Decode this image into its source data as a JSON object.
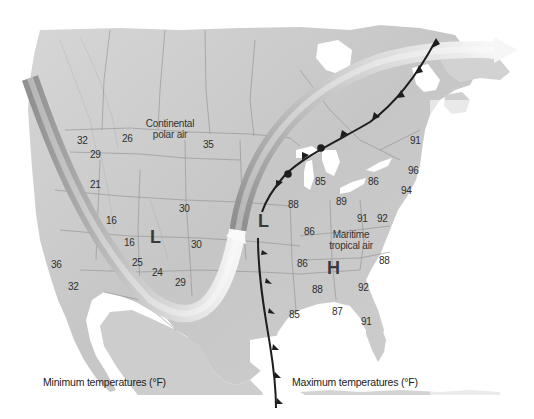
{
  "figure": {
    "cropped_top_text": "",
    "captions": {
      "left": "Minimum temperatures (°F)",
      "right": "Maximum temperatures (°F)"
    },
    "air_masses": [
      {
        "id": "continental-polar",
        "line1": "Continental",
        "line2": "polar air",
        "x": 135,
        "y": 118
      },
      {
        "id": "maritime-tropical",
        "line1": "Maritime",
        "line2": "tropical air",
        "x": 323,
        "y": 229
      }
    ],
    "pressure_centers": [
      {
        "id": "low-west",
        "symbol": "L",
        "x": 150,
        "y": 231
      },
      {
        "id": "low-central",
        "symbol": "L",
        "x": 258,
        "y": 215
      },
      {
        "id": "high-southeast",
        "symbol": "H",
        "x": 328,
        "y": 262
      }
    ],
    "min_temperatures": [
      {
        "value": "32",
        "x": 77,
        "y": 136
      },
      {
        "value": "26",
        "x": 122,
        "y": 134
      },
      {
        "value": "35",
        "x": 203,
        "y": 140
      },
      {
        "value": "29",
        "x": 90,
        "y": 150
      },
      {
        "value": "21",
        "x": 90,
        "y": 180
      },
      {
        "value": "30",
        "x": 179,
        "y": 204
      },
      {
        "value": "16",
        "x": 106,
        "y": 216
      },
      {
        "value": "16",
        "x": 124,
        "y": 238
      },
      {
        "value": "30",
        "x": 191,
        "y": 240
      },
      {
        "value": "36",
        "x": 51,
        "y": 260
      },
      {
        "value": "25",
        "x": 132,
        "y": 258
      },
      {
        "value": "24",
        "x": 152,
        "y": 268
      },
      {
        "value": "32",
        "x": 68,
        "y": 282
      },
      {
        "value": "29",
        "x": 175,
        "y": 278
      }
    ],
    "max_temperatures": [
      {
        "value": "91",
        "x": 410,
        "y": 136
      },
      {
        "value": "85",
        "x": 315,
        "y": 177
      },
      {
        "value": "86",
        "x": 368,
        "y": 177
      },
      {
        "value": "96",
        "x": 408,
        "y": 166
      },
      {
        "value": "94",
        "x": 401,
        "y": 186
      },
      {
        "value": "88",
        "x": 288,
        "y": 200
      },
      {
        "value": "89",
        "x": 336,
        "y": 197
      },
      {
        "value": "91",
        "x": 357,
        "y": 214
      },
      {
        "value": "92",
        "x": 377,
        "y": 214
      },
      {
        "value": "86",
        "x": 304,
        "y": 227
      },
      {
        "value": "86",
        "x": 297,
        "y": 259
      },
      {
        "value": "88",
        "x": 379,
        "y": 256
      },
      {
        "value": "88",
        "x": 312,
        "y": 285
      },
      {
        "value": "92",
        "x": 358,
        "y": 283
      },
      {
        "value": "85",
        "x": 289,
        "y": 310
      },
      {
        "value": "87",
        "x": 332,
        "y": 307
      },
      {
        "value": "91",
        "x": 361,
        "y": 317
      }
    ],
    "colors": {
      "land": "#c9c9c9",
      "water": "#ffffff",
      "front": "#1e1e1e",
      "jet_light": "#f4f4f4",
      "jet_dark": "#9a9a9a"
    }
  }
}
